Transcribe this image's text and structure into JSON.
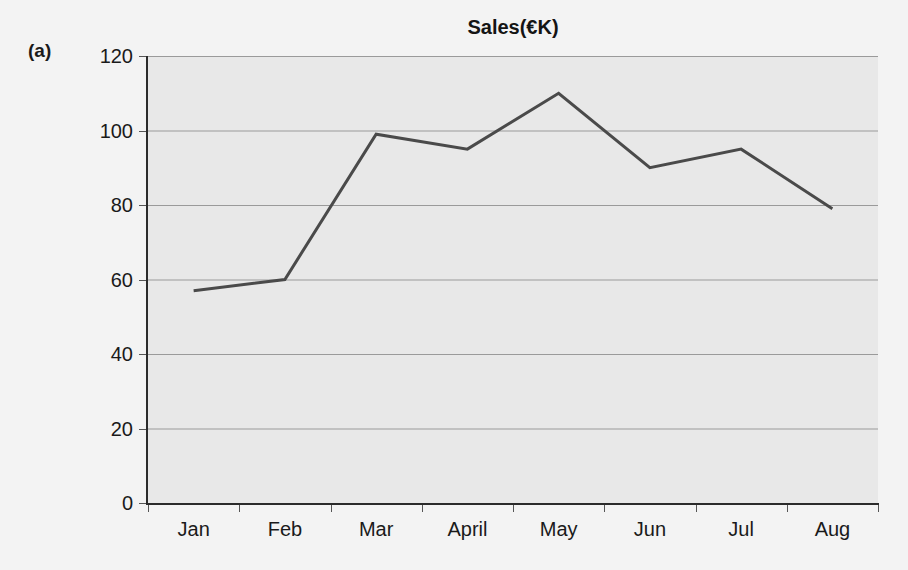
{
  "panel": {
    "letter": "(a)"
  },
  "chart_data": {
    "type": "line",
    "title": "Sales(€K)",
    "xlabel": "",
    "ylabel": "",
    "categories": [
      "Jan",
      "Feb",
      "Mar",
      "April",
      "May",
      "Jun",
      "Jul",
      "Aug"
    ],
    "values": [
      57,
      60,
      99,
      95,
      110,
      90,
      95,
      79
    ],
    "series": [
      {
        "name": "Sales(€K)",
        "values": [
          57,
          60,
          99,
          95,
          110,
          90,
          95,
          79
        ],
        "color": "#4a4a4a"
      }
    ],
    "ylim": [
      0,
      120
    ],
    "yticks": [
      0,
      20,
      40,
      60,
      80,
      100,
      120
    ],
    "ytick_labels": [
      "0",
      "20",
      "40",
      "60",
      "80",
      "100",
      "120"
    ],
    "grid": "horizontal",
    "legend": "none",
    "plot_background": "#e8e8e8",
    "figure_background": "#f3f3f3",
    "gridline_color": "#9a9a9a",
    "axis_color": "#2b2b2b",
    "line_color": "#4a4a4a",
    "line_width": 3
  }
}
